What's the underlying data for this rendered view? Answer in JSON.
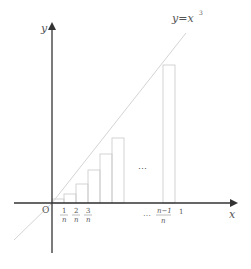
{
  "diagram": {
    "type": "riemann-sum",
    "curve_label": "y=x³",
    "curve_label_base": "y=x",
    "curve_label_exp": "3",
    "axes": {
      "x_label": "x",
      "y_label": "y",
      "origin_label": "O"
    },
    "ticks": [
      {
        "num": "1",
        "den": "n"
      },
      {
        "num": "2",
        "den": "n"
      },
      {
        "num": "3",
        "den": "n"
      },
      {
        "num": "n−1",
        "den": "n"
      }
    ],
    "tick_one": "1",
    "ellipsis_axis": "…",
    "ellipsis_middle": "⋯",
    "colors": {
      "axis": "#444444",
      "curve": "#d0d0d0",
      "rect": "#c8c8c8",
      "text": "#555555"
    }
  }
}
